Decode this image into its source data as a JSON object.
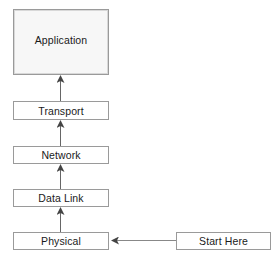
{
  "diagram": {
    "layers": [
      {
        "id": "application",
        "label": "Application"
      },
      {
        "id": "transport",
        "label": "Transport"
      },
      {
        "id": "network",
        "label": "Network"
      },
      {
        "id": "data-link",
        "label": "Data Link"
      },
      {
        "id": "physical",
        "label": "Physical"
      }
    ],
    "start": {
      "label": "Start Here"
    },
    "edges": [
      {
        "from": "start",
        "to": "physical",
        "direction": "left"
      },
      {
        "from": "physical",
        "to": "data-link",
        "direction": "up"
      },
      {
        "from": "data-link",
        "to": "network",
        "direction": "up"
      },
      {
        "from": "network",
        "to": "transport",
        "direction": "up"
      },
      {
        "from": "transport",
        "to": "application",
        "direction": "up"
      }
    ],
    "colors": {
      "border": "#9a9a9a",
      "arrow": "#555555",
      "text": "#1a1a1a",
      "app_fill": "#f7f7f7"
    }
  }
}
